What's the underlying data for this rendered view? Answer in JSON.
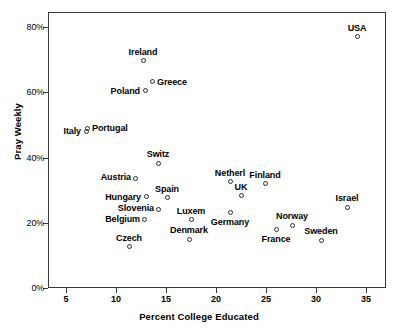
{
  "chart_data": {
    "type": "scatter",
    "title": "",
    "xlabel": "Percent College Educated",
    "ylabel": "Pray Weekly",
    "xlim": [
      3.0,
      37.0
    ],
    "ylim": [
      0,
      84.6
    ],
    "grid": false,
    "legend": "none",
    "x_ticks": [
      {
        "value": 5,
        "label": "5"
      },
      {
        "value": 10,
        "label": "10"
      },
      {
        "value": 15,
        "label": "15"
      },
      {
        "value": 20,
        "label": "20"
      },
      {
        "value": 25,
        "label": "25"
      },
      {
        "value": 30,
        "label": "30"
      },
      {
        "value": 35,
        "label": "35"
      }
    ],
    "y_ticks": [
      {
        "value": 0,
        "label": "0%"
      },
      {
        "value": 20,
        "label": "20%"
      },
      {
        "value": 40,
        "label": "40%"
      },
      {
        "value": 60,
        "label": "60%"
      },
      {
        "value": 80,
        "label": "80%"
      }
    ],
    "points": [
      {
        "name": "USA",
        "x": 34.1,
        "y": 77.0,
        "label_pos": "above"
      },
      {
        "name": "Ireland",
        "x": 12.7,
        "y": 69.6,
        "label_pos": "above"
      },
      {
        "name": "Greece",
        "x": 13.6,
        "y": 63.2,
        "label_pos": "right"
      },
      {
        "name": "Poland",
        "x": 12.9,
        "y": 60.5,
        "label_pos": "left"
      },
      {
        "name": "Portugal",
        "x": 7.1,
        "y": 49.0,
        "label_pos": "right"
      },
      {
        "name": "Italy",
        "x": 7.0,
        "y": 48.0,
        "label_pos": "left"
      },
      {
        "name": "Switz",
        "x": 14.2,
        "y": 38.3,
        "label_pos": "above"
      },
      {
        "name": "Austria",
        "x": 11.9,
        "y": 33.7,
        "label_pos": "below-left"
      },
      {
        "name": "Netherl",
        "x": 21.4,
        "y": 32.5,
        "label_pos": "above"
      },
      {
        "name": "Finland",
        "x": 24.9,
        "y": 31.9,
        "label_pos": "above"
      },
      {
        "name": "Hungary",
        "x": 13.0,
        "y": 27.9,
        "label_pos": "left"
      },
      {
        "name": "Spain",
        "x": 15.1,
        "y": 27.6,
        "label_pos": "above"
      },
      {
        "name": "UK",
        "x": 22.5,
        "y": 28.2,
        "label_pos": "above"
      },
      {
        "name": "Israel",
        "x": 33.1,
        "y": 24.8,
        "label_pos": "above"
      },
      {
        "name": "Slovenia",
        "x": 14.2,
        "y": 24.2,
        "label_pos": "below-left"
      },
      {
        "name": "Germany",
        "x": 21.4,
        "y": 23.0,
        "label_pos": "below"
      },
      {
        "name": "Belgium",
        "x": 12.8,
        "y": 20.9,
        "label_pos": "below-left"
      },
      {
        "name": "Luxem",
        "x": 17.5,
        "y": 20.9,
        "label_pos": "above"
      },
      {
        "name": "Norway",
        "x": 27.6,
        "y": 19.2,
        "label_pos": "above"
      },
      {
        "name": "France",
        "x": 26.0,
        "y": 17.9,
        "label_pos": "below"
      },
      {
        "name": "Denmark",
        "x": 17.3,
        "y": 15.0,
        "label_pos": "above"
      },
      {
        "name": "Sweden",
        "x": 30.5,
        "y": 14.7,
        "label_pos": "above"
      },
      {
        "name": "Czech",
        "x": 11.3,
        "y": 12.6,
        "label_pos": "above"
      }
    ]
  },
  "axis": {
    "x_title": "Percent College Educated",
    "y_title": "Pray Weekly"
  }
}
